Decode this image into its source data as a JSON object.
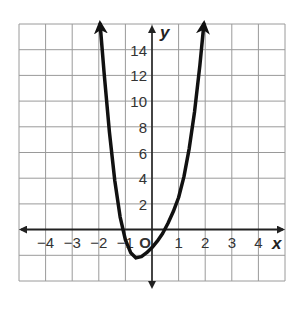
{
  "chart_data": {
    "type": "line",
    "title": "",
    "xlabel": "x",
    "ylabel": "y",
    "xlim": [
      -5,
      5
    ],
    "ylim": [
      -4,
      16
    ],
    "grid": true,
    "x_ticks": [
      "−4",
      "−3",
      "−2",
      "−1",
      "1",
      "2",
      "3",
      "4"
    ],
    "y_ticks": [
      "2",
      "4",
      "6",
      "8",
      "10",
      "12",
      "14"
    ],
    "origin_label": "O",
    "series": [
      {
        "name": "polynomial curve",
        "x": [
          -1.95,
          -1.8,
          -1.6,
          -1.4,
          -1.2,
          -1.0,
          -0.8,
          -0.6,
          -0.4,
          -0.2,
          0.0,
          0.2,
          0.4,
          0.6,
          0.8,
          1.0,
          1.2,
          1.4,
          1.6,
          1.8,
          1.95
        ],
        "y": [
          16,
          12.2,
          7.6,
          3.8,
          1.0,
          -0.8,
          -1.8,
          -2.2,
          -2.1,
          -1.8,
          -1.4,
          -0.9,
          -0.3,
          0.5,
          1.4,
          2.5,
          4.1,
          6.3,
          9.2,
          12.8,
          16
        ]
      }
    ],
    "annotations": [
      "arrows at both ends of curve",
      "arrows on axes"
    ]
  },
  "colors": {
    "grid": "#9a9a9a",
    "axis": "#222222",
    "curve": "#111111",
    "background": "#ffffff"
  }
}
